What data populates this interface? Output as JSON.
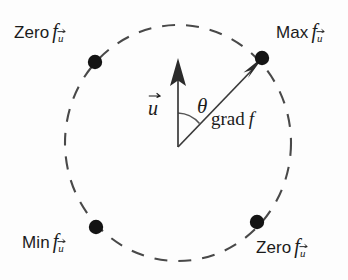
{
  "figure": {
    "background_color": "#fdfdfd",
    "stroke_color": "#3a3a3a",
    "dot_color": "#1a1a1a",
    "circle": {
      "center_x": 178,
      "center_y": 143,
      "radius_x": 113,
      "radius_y": 118,
      "style": "dashed"
    },
    "vectors": [
      {
        "name": "u",
        "label": "u",
        "from_x": 178,
        "from_y": 147,
        "to_x": 178,
        "to_y": 62,
        "angle_deg": 90,
        "arrowhead": "solid"
      },
      {
        "name": "grad f",
        "label": "grad f",
        "from_x": 178,
        "from_y": 147,
        "to_x": 262,
        "to_y": 60,
        "angle_deg": 46,
        "arrowhead": "solid"
      }
    ],
    "angle_arc": {
      "label": "theta",
      "symbol": "θ",
      "between": [
        "u",
        "grad f"
      ],
      "value_deg": 44,
      "radius": 34
    },
    "points": [
      {
        "id": "max",
        "word": "Max",
        "fn": "f",
        "subscript": "u",
        "label": "Max fᵤ",
        "dot_x": 262,
        "dot_y": 58,
        "angle_deg": 46,
        "label_x": 276,
        "label_y": 30,
        "label_align": "left"
      },
      {
        "id": "zero-top-left",
        "word": "Zero",
        "fn": "f",
        "subscript": "u",
        "label": "Zero fᵤ",
        "dot_x": 95,
        "dot_y": 62,
        "angle_deg": 136,
        "label_x": 14,
        "label_y": 30,
        "label_align": "left"
      },
      {
        "id": "min",
        "word": "Min",
        "fn": "f",
        "subscript": "u",
        "label": "Min fᵤ",
        "dot_x": 96,
        "dot_y": 227,
        "angle_deg": 226,
        "label_x": 22,
        "label_y": 235,
        "label_align": "left"
      },
      {
        "id": "zero-bottom-right",
        "word": "Zero",
        "fn": "f",
        "subscript": "u",
        "label": "Zero fᵤ",
        "dot_x": 257,
        "dot_y": 222,
        "angle_deg": 316,
        "label_x": 258,
        "label_y": 240,
        "label_align": "left"
      }
    ],
    "math_labels": {
      "u_vector": "u",
      "theta": "θ",
      "grad_word": "grad",
      "grad_fn": "f",
      "f_glyph": "f",
      "subscript_u": "u"
    }
  }
}
